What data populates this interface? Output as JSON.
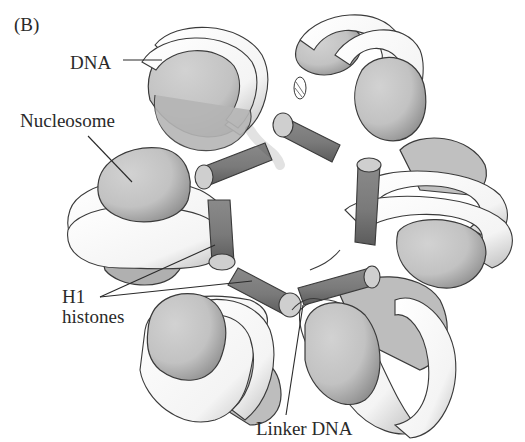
{
  "figure": {
    "panel_label": "(B)",
    "labels": {
      "dna": "DNA",
      "nucleosome": "Nucleosome",
      "h1_line1": "H1",
      "h1_line2": "histones",
      "linker_dna": "Linker DNA"
    },
    "nucleosome_count": 6,
    "h1_histone_count": 6
  },
  "colors": {
    "background": "#ffffff",
    "outline": "#3a3a3a",
    "nucleosome_core": "#c4c4c4",
    "nucleosome_shadow": "#8e8e8e",
    "dna_wrap": "#ffffff",
    "dna_stipple": "#9a9a9a",
    "h1_cylinder": "#7d7d7d",
    "h1_cylinder_dark": "#5e5e5e",
    "h1_cap": "#cfcfcf",
    "leader_line": "#2a2a2a",
    "text": "#2a2a2a"
  }
}
